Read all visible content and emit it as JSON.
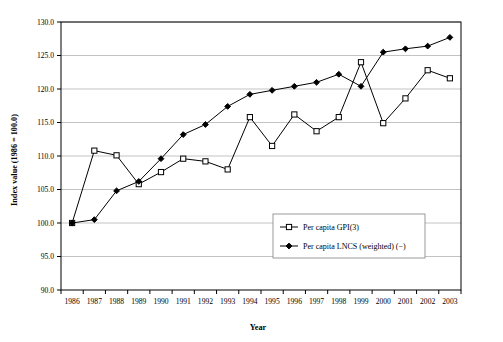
{
  "chart_data": {
    "type": "line",
    "title": "",
    "xlabel": "Year",
    "ylabel": "Index value (1986 = 100.0)",
    "categories": [
      1986,
      1987,
      1988,
      1989,
      1990,
      1991,
      1992,
      1993,
      1994,
      1995,
      1996,
      1997,
      1998,
      1999,
      2000,
      2001,
      2002,
      2003
    ],
    "xtick_labels": [
      "1986",
      "1987",
      "1988",
      "1989",
      "1990",
      "1991",
      "1992",
      "1993",
      "1994",
      "1995",
      "1996",
      "1997",
      "1998",
      "1999",
      "2000",
      "2001",
      "2002",
      "2003"
    ],
    "ytick_labels": [
      "90.0",
      "95.0",
      "100.0",
      "105.0",
      "110.0",
      "115.0",
      "120.0",
      "125.0",
      "130.0"
    ],
    "ytick_values": [
      90.0,
      95.0,
      100.0,
      105.0,
      110.0,
      115.0,
      120.0,
      125.0,
      130.0
    ],
    "ylim": [
      90.0,
      130.0
    ],
    "grid": "horizontal",
    "legend_position": "center-lower-right",
    "series": [
      {
        "name": "Per capita GPI(3)",
        "marker": "open-square",
        "values": [
          100.0,
          110.8,
          110.1,
          105.8,
          107.6,
          109.6,
          109.2,
          108.0,
          115.8,
          111.5,
          116.2,
          113.7,
          115.8,
          124.0,
          114.9,
          118.6,
          122.8,
          121.6
        ]
      },
      {
        "name": "Per capita LNCS (weighted) (−)",
        "marker": "filled-diamond",
        "values": [
          100.0,
          100.5,
          104.8,
          106.2,
          109.6,
          113.2,
          114.7,
          117.4,
          119.2,
          119.8,
          120.4,
          121.0,
          122.2,
          120.4,
          125.5,
          126.0,
          126.4,
          127.7
        ]
      }
    ]
  }
}
